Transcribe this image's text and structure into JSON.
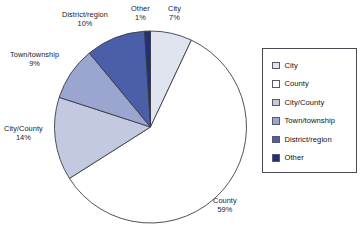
{
  "chart_data": {
    "type": "pie",
    "title": "",
    "legend_position": "right",
    "categories": [
      "City",
      "County",
      "City/County",
      "Town/township",
      "District/region",
      "Other"
    ],
    "values": [
      7,
      59,
      14,
      9,
      10,
      1
    ],
    "unit": "%",
    "colors": [
      "#dfe4ef",
      "#ffffff",
      "#c3c9e0",
      "#9aa5d0",
      "#4a5fa8",
      "#1f2f7a"
    ],
    "start_angle_deg": 0,
    "direction": "clockwise",
    "slices": [
      {
        "label": "City",
        "value": 7,
        "value_text": "7%",
        "color": "#dfe4ef"
      },
      {
        "label": "County",
        "value": 59,
        "value_text": "59%",
        "color": "#ffffff"
      },
      {
        "label": "City/County",
        "value": 14,
        "value_text": "14%",
        "color": "#c3c9e0"
      },
      {
        "label": "Town/township",
        "value": 9,
        "value_text": "9%",
        "color": "#9aa5d0"
      },
      {
        "label": "District/region",
        "value": 10,
        "value_text": "10%",
        "color": "#4a5fa8"
      },
      {
        "label": "Other",
        "value": 1,
        "value_text": "1%",
        "color": "#1f2f7a"
      }
    ]
  },
  "legend": {
    "items": [
      {
        "label": "City",
        "color": "#dfe4ef"
      },
      {
        "label": "County",
        "color": "#ffffff"
      },
      {
        "label": "City/County",
        "color": "#c3c9e0"
      },
      {
        "label": "Town/township",
        "color": "#9aa5d0"
      },
      {
        "label": "District/region",
        "color": "#4a5fa8"
      },
      {
        "label": "Other",
        "color": "#1f2f7a"
      }
    ]
  },
  "style": {
    "outline_color": "#3d3d48",
    "background": "#ffffff"
  }
}
